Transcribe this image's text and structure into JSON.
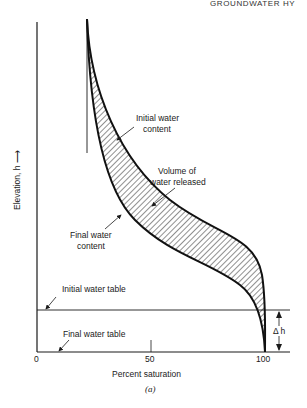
{
  "header": {
    "running_title": "GROUNDWATER HY"
  },
  "figure": {
    "caption": "(a)",
    "y_axis_label": "Elevation, h ⟶",
    "x_axis_label": "Percent saturation",
    "x_ticks": [
      "0",
      "50",
      "100"
    ],
    "annotations": {
      "initial_water_content_line1": "Initial water",
      "initial_water_content_line2": "content",
      "volume_released_line1": "Volume of",
      "volume_released_line2": "water released",
      "final_water_content_line1": "Final water",
      "final_water_content_line2": "content",
      "initial_water_table": "Initial water table",
      "final_water_table": "Final water table",
      "delta_h": "Δ h"
    }
  }
}
